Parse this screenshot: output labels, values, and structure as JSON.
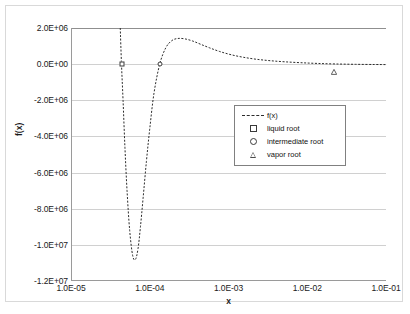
{
  "chart_data": {
    "type": "line",
    "title": "",
    "xlabel": "x",
    "ylabel": "f(x)",
    "xscale": "log",
    "yscale": "linear",
    "xlim": [
      1e-05,
      0.1
    ],
    "ylim": [
      -12000000.0,
      2000000.0
    ],
    "grid": true,
    "legend_position": "center-right",
    "x_tick_labels": [
      "1.0E-05",
      "1.0E-04",
      "1.0E-03",
      "1.0E-02",
      "1.0E-01"
    ],
    "x_tick_values": [
      1e-05,
      0.0001,
      0.001,
      0.01,
      0.1
    ],
    "y_tick_labels": [
      "2.0E+06",
      "0.0E+00",
      "-2.0E+06",
      "-4.0E+06",
      "-6.0E+06",
      "-8.0E+06",
      "-1.0E+07",
      "-1.2E+07"
    ],
    "y_tick_values": [
      2000000.0,
      0.0,
      -2000000.0,
      -4000000.0,
      -6000000.0,
      -8000000.0,
      -10000000.0,
      -12000000.0
    ],
    "series": [
      {
        "name": "f(x)",
        "style": "dashed-line",
        "x": [
          4.1e-05,
          4.25e-05,
          4.45e-05,
          4.7e-05,
          5e-05,
          5.4e-05,
          5.9e-05,
          6.4e-05,
          6.9e-05,
          7.4e-05,
          8e-05,
          8.8e-05,
          9.7e-05,
          0.00011,
          0.00013,
          0.000155,
          0.000185,
          0.00022,
          0.00027,
          0.00034,
          0.00043,
          0.00056,
          0.00075,
          0.00105,
          0.0015,
          0.0022,
          0.0033,
          0.005,
          0.008,
          0.013,
          0.022,
          0.04,
          0.07,
          0.1
        ],
        "y": [
          2000000.0,
          0.0,
          -2000000.0,
          -4600000.0,
          -7000000.0,
          -9200000.0,
          -10600000.0,
          -10800000.0,
          -10200000.0,
          -9000000.0,
          -7400000.0,
          -5400000.0,
          -3600000.0,
          -1600000.0,
          0.0,
          900000.0,
          1300000.0,
          1420000.0,
          1400000.0,
          1280000.0,
          1100000.0,
          900000.0,
          700000.0,
          520000.0,
          380000.0,
          270000.0,
          190000.0,
          130000.0,
          80000.0,
          40000.0,
          10000.0,
          -10000.0,
          -20000.0,
          -25000.0
        ]
      },
      {
        "name": "liquid root",
        "style": "square-marker",
        "x": [
          4.28e-05
        ],
        "y": [
          0.0
        ]
      },
      {
        "name": "intermediate root",
        "style": "circle-marker",
        "x": [
          0.00013
        ],
        "y": [
          0.0
        ]
      },
      {
        "name": "vapor root",
        "style": "triangle-marker",
        "x": [
          0.0215
        ],
        "y": [
          0.0
        ]
      }
    ],
    "legend_entries": [
      {
        "label": "f(x)",
        "key": "dashed-line"
      },
      {
        "label": "liquid root",
        "key": "square-marker"
      },
      {
        "label": "intermediate root",
        "key": "circle-marker"
      },
      {
        "label": "vapor root",
        "key": "triangle-marker"
      }
    ]
  }
}
